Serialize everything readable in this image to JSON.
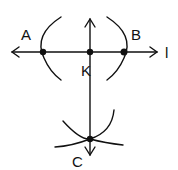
{
  "diagram": {
    "type": "geometric-construction",
    "line_label": "l",
    "points": [
      {
        "id": "A",
        "label": "A",
        "x": 43,
        "y": 52
      },
      {
        "id": "K",
        "label": "K",
        "x": 90,
        "y": 52
      },
      {
        "id": "B",
        "label": "B",
        "x": 124,
        "y": 52
      },
      {
        "id": "C",
        "label": "C",
        "x": 90,
        "y": 139
      }
    ],
    "colors": {
      "stroke": "#111111",
      "background": "#ffffff"
    }
  }
}
